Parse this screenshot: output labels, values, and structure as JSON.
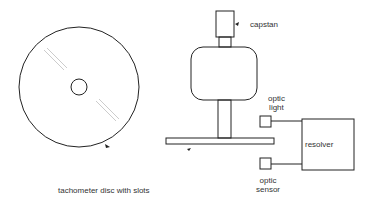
{
  "diagram": {
    "labels": {
      "disc": "tachometer disc with slots",
      "capstan": "capstan",
      "optic_light_1": "optic",
      "optic_light_2": "light",
      "resolver": "resolver",
      "optic_sensor_1": "optic",
      "optic_sensor_2": "sensor"
    }
  }
}
